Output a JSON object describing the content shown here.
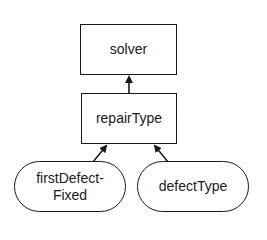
{
  "diagram": {
    "type": "dependency-graph",
    "nodes": [
      {
        "id": "solver",
        "label": "solver",
        "shape": "rectangle"
      },
      {
        "id": "repairType",
        "label": "repairType",
        "shape": "rectangle"
      },
      {
        "id": "firstDefectFixed",
        "label_line1": "firstDefect-",
        "label_line2": "Fixed",
        "shape": "rounded"
      },
      {
        "id": "defectType",
        "label": "defectType",
        "shape": "rounded"
      }
    ],
    "edges": [
      {
        "from": "repairType",
        "to": "solver"
      },
      {
        "from": "firstDefectFixed",
        "to": "repairType"
      },
      {
        "from": "defectType",
        "to": "repairType"
      }
    ],
    "colors": {
      "stroke": "#1a1a1a",
      "background": "#ffffff"
    }
  }
}
